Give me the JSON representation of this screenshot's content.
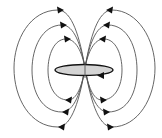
{
  "diagram": {
    "title": "",
    "colors": {
      "background": "#ffffff",
      "field_line": "#555555",
      "arrow": "#111111",
      "loop_fill": "#d4d4d4",
      "loop_stroke": "#111111"
    },
    "center": {
      "x": 85,
      "y": 68
    },
    "current_loop": {
      "cx": 84,
      "cy": 70,
      "rx": 29,
      "ry": 5.5,
      "arrow_direction": "leftward-on-front"
    },
    "field_lines": [
      {
        "side": "left",
        "level": "inner",
        "top_y": 39,
        "bottom_y": 100,
        "extreme_x": 48
      },
      {
        "side": "left",
        "level": "middle",
        "top_y": 25,
        "bottom_y": 112,
        "extreme_x": 32
      },
      {
        "side": "left",
        "level": "outer",
        "top_y": 10,
        "bottom_y": 127,
        "extreme_x": 14
      },
      {
        "side": "right",
        "level": "inner",
        "top_y": 39,
        "bottom_y": 100,
        "extreme_x": 122
      },
      {
        "side": "right",
        "level": "middle",
        "top_y": 25,
        "bottom_y": 112,
        "extreme_x": 137
      },
      {
        "side": "right",
        "level": "outer",
        "top_y": 10,
        "bottom_y": 127,
        "extreme_x": 155
      }
    ],
    "arrow_count": 13,
    "labels": []
  }
}
